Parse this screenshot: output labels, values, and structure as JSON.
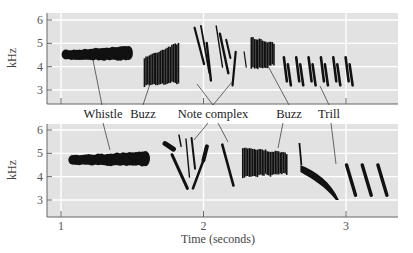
{
  "chart_data": {
    "type": "spectrogram",
    "xlabel": "Time (seconds)",
    "ylabel": "kHz",
    "x_ticks": [
      1,
      2,
      3
    ],
    "y_ticks": [
      3,
      4,
      5,
      6
    ],
    "xlim": [
      0.9,
      3.35
    ],
    "ylim": [
      2.4,
      6.3
    ],
    "grid": true,
    "panel_background": "#e2e2e2",
    "ink_color": "#111111",
    "annotations": [
      {
        "label": "Whistle",
        "x": 1.28
      },
      {
        "label": "Buzz",
        "x": 1.63
      },
      {
        "label": "Note complex",
        "x": 2.08
      },
      {
        "label": "Buzz",
        "x": 2.5
      },
      {
        "label": "Trill",
        "x": 2.84
      }
    ],
    "panels": [
      {
        "name": "top",
        "segments": [
          {
            "type": "whistle",
            "t_start": 1.02,
            "t_end": 1.48,
            "f_low": 4.2,
            "f_high": 4.8
          },
          {
            "type": "buzz",
            "t_start": 1.58,
            "t_end": 1.83,
            "f_low": 3.2,
            "f_high": 5.1
          },
          {
            "type": "note_complex",
            "t_start": 1.93,
            "t_end": 2.3,
            "f_low": 3.2,
            "f_high": 5.8
          },
          {
            "type": "buzz",
            "t_start": 2.33,
            "t_end": 2.5,
            "f_low": 3.9,
            "f_high": 5.3
          },
          {
            "type": "trill",
            "t_start": 2.55,
            "t_end": 3.07,
            "f_low": 3.2,
            "f_high": 4.4
          }
        ]
      },
      {
        "name": "bottom",
        "segments": [
          {
            "type": "whistle",
            "t_start": 1.07,
            "t_end": 1.6,
            "f_low": 4.4,
            "f_high": 5.0
          },
          {
            "type": "note_complex",
            "t_start": 1.73,
            "t_end": 2.22,
            "f_low": 3.5,
            "f_high": 5.9
          },
          {
            "type": "buzz",
            "t_start": 2.27,
            "t_end": 2.59,
            "f_low": 4.0,
            "f_high": 5.3
          },
          {
            "type": "downsweep",
            "t_start": 2.68,
            "t_end": 2.95,
            "f_low": 3.0,
            "f_high": 4.5
          },
          {
            "type": "trill",
            "t_start": 2.99,
            "t_end": 3.32,
            "f_low": 3.2,
            "f_high": 4.5
          }
        ]
      }
    ]
  }
}
